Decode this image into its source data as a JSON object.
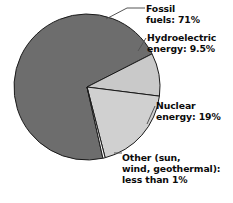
{
  "chart_data": {
    "type": "pie",
    "title": "",
    "subtitle": "",
    "xlabel": "",
    "ylabel": "",
    "legend_position": "callout-labels",
    "grid": false,
    "units": "percent",
    "center": {
      "x": 87,
      "y": 87
    },
    "radius": 73,
    "categories": [
      "Fossil fuels",
      "Hydroelectric energy",
      "Nuclear energy",
      "Other (sun, wind, geothermal)"
    ],
    "values": [
      71,
      9.5,
      19,
      0.5
    ],
    "value_labels": [
      "71%",
      "9.5%",
      "19%",
      "less than 1%"
    ],
    "colors": [
      "#6d6d6d",
      "#c9c9c9",
      "#d0d0d0",
      "#fdfdfd"
    ],
    "slices": [
      {
        "name": "fossil-fuels",
        "label_line1": "Fossil",
        "label_line2": "fuels: 71%",
        "value": 71,
        "value_text": "71%",
        "color": "#6d6d6d",
        "start_angle_deg": -27,
        "end_angle_deg": 229.6
      },
      {
        "name": "hydroelectric-energy",
        "label_line1": "Hydroelectric",
        "label_line2": "energy: 9.5%",
        "value": 9.5,
        "value_text": "9.5%",
        "color": "#c9c9c9",
        "start_angle_deg": -27,
        "end_angle_deg": 0.8
      },
      {
        "name": "nuclear-energy",
        "label_line1": "Nuclear",
        "label_line2": "energy: 19%",
        "value": 19,
        "value_text": "19%",
        "color": "#d0d0d0",
        "start_angle_deg": 0.8,
        "end_angle_deg": 69.2
      },
      {
        "name": "other-sources",
        "label_line1": "Other (sun,",
        "label_line2": "wind, geothermal):",
        "label_line3": "less than 1%",
        "value": 0.5,
        "value_text": "less than 1%",
        "color": "#fdfdfd",
        "start_angle_deg": 69.2,
        "end_angle_deg": 71.0
      }
    ],
    "labels": {
      "fossil": {
        "line1": "Fossil",
        "line2": "fuels: 71%"
      },
      "hydro": {
        "line1": "Hydroelectric",
        "line2": "energy: 9.5%"
      },
      "nuclear": {
        "line1": "Nuclear",
        "line2": "energy: 19%"
      },
      "other": {
        "line1": "Other (sun,",
        "line2": "wind, geothermal):",
        "line3": "less than 1%"
      }
    },
    "style": {
      "stroke_color": "#1a1a1a",
      "stroke_width": 1,
      "leader_color": "#4a4a4a",
      "background": "#ffffff",
      "text_color": "#0b0b0b"
    }
  }
}
